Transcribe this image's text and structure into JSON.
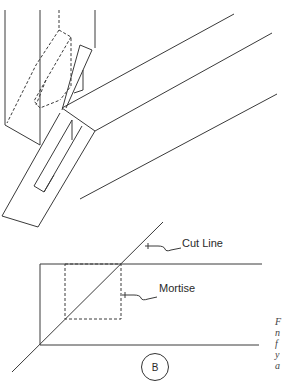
{
  "figure": {
    "top_view": {
      "description": "isometric view of angled brace tenon entering post mortise"
    },
    "bottom_view": {
      "labels": {
        "cut_line": "Cut Line",
        "mortise": "Mortise"
      },
      "view_marker": "B"
    },
    "caption_fragment": [
      "F",
      "n",
      "f",
      "y",
      "a"
    ]
  }
}
